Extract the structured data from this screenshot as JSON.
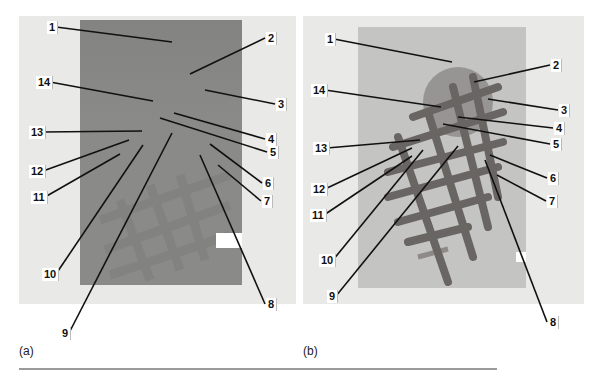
{
  "figure": {
    "panels": [
      {
        "id": "a",
        "caption": "(a)",
        "frame": {
          "x": 19,
          "y": 16,
          "w": 277,
          "h": 288
        },
        "photo": {
          "x": 80,
          "y": 20,
          "w": 162,
          "h": 265
        },
        "labels": [
          {
            "n": "1",
            "lx": 47,
            "ly": 21,
            "tx": 172,
            "ty": 42
          },
          {
            "n": "2",
            "lx": 266,
            "ly": 32,
            "tx": 190,
            "ty": 74
          },
          {
            "n": "3",
            "lx": 276,
            "ly": 98,
            "tx": 205,
            "ty": 90
          },
          {
            "n": "4",
            "lx": 266,
            "ly": 133,
            "tx": 174,
            "ty": 113
          },
          {
            "n": "5",
            "lx": 268,
            "ly": 146,
            "tx": 160,
            "ty": 118
          },
          {
            "n": "6",
            "lx": 263,
            "ly": 177,
            "tx": 210,
            "ty": 144
          },
          {
            "n": "7",
            "lx": 262,
            "ly": 195,
            "tx": 218,
            "ty": 165
          },
          {
            "n": "8",
            "lx": 266,
            "ly": 298,
            "tx": 200,
            "ty": 155
          },
          {
            "n": "9",
            "lx": 60,
            "ly": 327,
            "tx": 172,
            "ty": 133
          },
          {
            "n": "10",
            "lx": 42,
            "ly": 268,
            "tx": 143,
            "ty": 145
          },
          {
            "n": "11",
            "lx": 31,
            "ly": 191,
            "tx": 120,
            "ty": 154
          },
          {
            "n": "12",
            "lx": 29,
            "ly": 165,
            "tx": 129,
            "ty": 140
          },
          {
            "n": "13",
            "lx": 29,
            "ly": 126,
            "tx": 142,
            "ty": 131
          },
          {
            "n": "14",
            "lx": 36,
            "ly": 76,
            "tx": 153,
            "ty": 101
          }
        ]
      },
      {
        "id": "b",
        "caption": "(b)",
        "frame": {
          "x": 303,
          "y": 16,
          "w": 281,
          "h": 288
        },
        "photo": {
          "x": 358,
          "y": 27,
          "w": 168,
          "h": 261
        },
        "labels": [
          {
            "n": "1",
            "lx": 325,
            "ly": 33,
            "tx": 452,
            "ty": 62
          },
          {
            "n": "2",
            "lx": 551,
            "ly": 59,
            "tx": 474,
            "ty": 82
          },
          {
            "n": "3",
            "lx": 559,
            "ly": 104,
            "tx": 488,
            "ty": 99
          },
          {
            "n": "4",
            "lx": 554,
            "ly": 122,
            "tx": 458,
            "ty": 117
          },
          {
            "n": "5",
            "lx": 551,
            "ly": 138,
            "tx": 443,
            "ty": 124
          },
          {
            "n": "6",
            "lx": 548,
            "ly": 172,
            "tx": 490,
            "ty": 155
          },
          {
            "n": "7",
            "lx": 547,
            "ly": 195,
            "tx": 497,
            "ty": 175
          },
          {
            "n": "8",
            "lx": 548,
            "ly": 316,
            "tx": 485,
            "ty": 160
          },
          {
            "n": "9",
            "lx": 327,
            "ly": 290,
            "tx": 458,
            "ty": 146
          },
          {
            "n": "10",
            "lx": 319,
            "ly": 254,
            "tx": 423,
            "ty": 150
          },
          {
            "n": "11",
            "lx": 310,
            "ly": 209,
            "tx": 412,
            "ty": 156
          },
          {
            "n": "12",
            "lx": 311,
            "ly": 183,
            "tx": 412,
            "ty": 148
          },
          {
            "n": "13",
            "lx": 313,
            "ly": 142,
            "tx": 420,
            "ty": 140
          },
          {
            "n": "14",
            "lx": 311,
            "ly": 84,
            "tx": 441,
            "ty": 107
          }
        ]
      }
    ],
    "colors": {
      "leader": "#111111",
      "frame": "#e9e9e7",
      "photo_a": "#8a8a88",
      "photo_b": "#c4c4c2",
      "mesh": "#5a5552"
    }
  }
}
